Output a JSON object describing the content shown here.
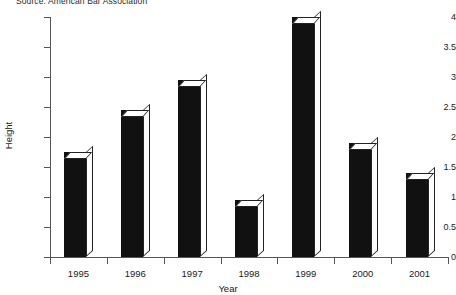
{
  "source_note": "Source: American Bar Association",
  "chart_data": {
    "type": "bar",
    "title": "",
    "subtitle": "",
    "xlabel": "Year",
    "ylabel": "Height",
    "categories": [
      "1995",
      "1996",
      "1997",
      "1998",
      "1999",
      "2000",
      "2001"
    ],
    "values": [
      1.75,
      2.45,
      2.95,
      0.95,
      4.0,
      1.9,
      1.4
    ],
    "ylim": [
      0,
      4
    ],
    "ytick_labels": [
      "0",
      "0.5",
      "1",
      "1.5",
      "2",
      "2.5",
      "3",
      "3.5",
      "4"
    ],
    "ytick_values": [
      0,
      0.5,
      1,
      1.5,
      2,
      2.5,
      3,
      3.5,
      4
    ],
    "grid": false,
    "legend": "none",
    "bar_color": "#111111",
    "bar_top_color": "#ffffff",
    "axis_color": "#555555"
  }
}
